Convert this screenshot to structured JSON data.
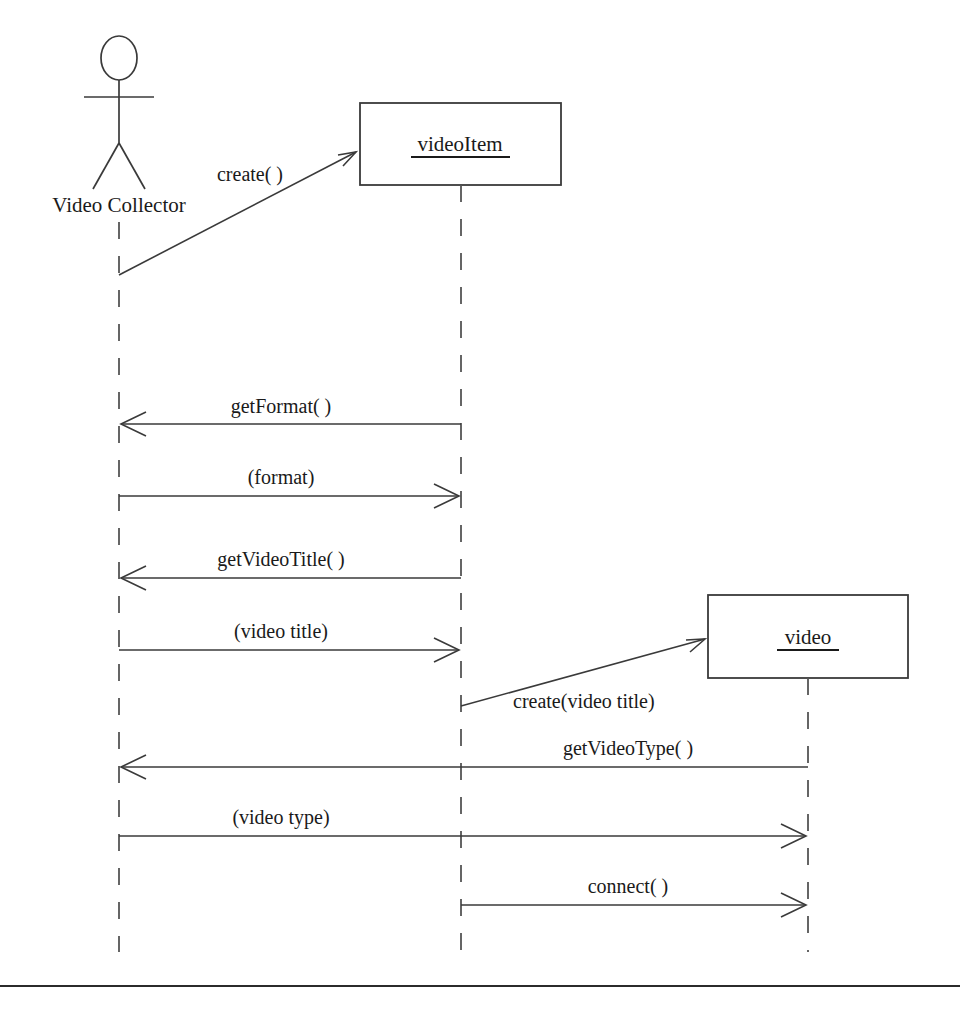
{
  "diagram": {
    "type": "uml-sequence-diagram",
    "title": "",
    "background_color": "#ffffff",
    "line_color": "#3a3a3a",
    "text_color": "#1a1a1a",
    "participants": [
      {
        "id": "actor",
        "kind": "actor",
        "label": "Video Collector",
        "label_x": 119,
        "label_y": 212,
        "lifeline_x": 119,
        "lifeline_top": 222,
        "lifeline_bottom": 952
      },
      {
        "id": "videoitem",
        "kind": "object",
        "label": "videoItem",
        "underlined": true,
        "box": {
          "x": 360,
          "y": 103,
          "width": 201,
          "height": 82
        },
        "lifeline_x": 461,
        "lifeline_top": 185,
        "lifeline_bottom": 952
      },
      {
        "id": "video",
        "kind": "object",
        "label": "video",
        "underlined": true,
        "box": {
          "x": 708,
          "y": 595,
          "width": 200,
          "height": 83
        },
        "lifeline_x": 808,
        "lifeline_top": 678,
        "lifeline_bottom": 952
      }
    ],
    "messages": [
      {
        "index": 1,
        "label": "create( )",
        "from": "actor",
        "to": "videoitem",
        "style": "diagonal",
        "direction": "right-up",
        "x1": 119,
        "y1": 275,
        "x2": 356,
        "y2": 152,
        "label_x": 250,
        "label_y": 181,
        "label_anchor": "middle"
      },
      {
        "index": 2,
        "label": "getFormat( )",
        "from": "videoitem",
        "to": "actor",
        "style": "horizontal",
        "direction": "left",
        "x1": 461,
        "y1": 424,
        "x2": 121,
        "y2": 424,
        "label_x": 281,
        "label_y": 413,
        "label_anchor": "middle"
      },
      {
        "index": 3,
        "label": "(format)",
        "from": "actor",
        "to": "videoitem",
        "style": "horizontal",
        "direction": "right",
        "x1": 119,
        "y1": 496,
        "x2": 459,
        "y2": 496,
        "label_x": 281,
        "label_y": 484,
        "label_anchor": "middle"
      },
      {
        "index": 4,
        "label": "getVideoTitle( )",
        "from": "videoitem",
        "to": "actor",
        "style": "horizontal",
        "direction": "left",
        "x1": 461,
        "y1": 578,
        "x2": 121,
        "y2": 578,
        "label_x": 281,
        "label_y": 566,
        "label_anchor": "middle"
      },
      {
        "index": 5,
        "label": "(video title)",
        "from": "actor",
        "to": "videoitem",
        "style": "horizontal",
        "direction": "right",
        "x1": 119,
        "y1": 650,
        "x2": 459,
        "y2": 650,
        "label_x": 281,
        "label_y": 638,
        "label_anchor": "middle"
      },
      {
        "index": 6,
        "label": "create(video title)",
        "from": "videoitem",
        "to": "video",
        "style": "diagonal",
        "direction": "right-up",
        "x1": 461,
        "y1": 706,
        "x2": 705,
        "y2": 639,
        "label_x": 513,
        "label_y": 708,
        "label_anchor": "start"
      },
      {
        "index": 7,
        "label": "getVideoType( )",
        "from": "video",
        "to": "actor",
        "style": "horizontal",
        "direction": "left",
        "x1": 808,
        "y1": 767,
        "x2": 121,
        "y2": 767,
        "label_x": 628,
        "label_y": 755,
        "label_anchor": "middle"
      },
      {
        "index": 8,
        "label": "(video type)",
        "from": "actor",
        "to": "video",
        "style": "horizontal",
        "direction": "right",
        "x1": 119,
        "y1": 836,
        "x2": 806,
        "y2": 836,
        "label_x": 281,
        "label_y": 824,
        "label_anchor": "middle"
      },
      {
        "index": 9,
        "label": "connect( )",
        "from": "videoitem",
        "to": "video",
        "style": "horizontal",
        "direction": "right",
        "x1": 461,
        "y1": 905,
        "x2": 806,
        "y2": 905,
        "label_x": 628,
        "label_y": 893,
        "label_anchor": "middle"
      }
    ],
    "footer_rule": {
      "x1": 0,
      "y1": 986,
      "x2": 960,
      "y2": 986
    }
  }
}
